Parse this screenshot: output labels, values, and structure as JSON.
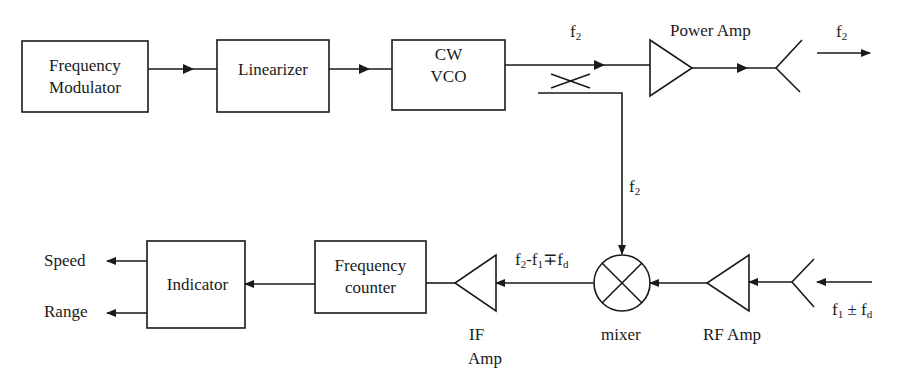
{
  "diagram": {
    "type": "block-diagram",
    "title": "",
    "blocks": {
      "frequency_modulator": {
        "line1": "Frequency",
        "line2": "Modulator"
      },
      "linearizer": {
        "label": "Linearizer"
      },
      "cw_vco": {
        "line1": "CW",
        "line2": "VCO"
      },
      "power_amp": {
        "label": "Power Amp"
      },
      "mixer": {
        "label": "mixer"
      },
      "rf_amp": {
        "label": "RF Amp"
      },
      "if_amp": {
        "line1": "IF",
        "line2": "Amp"
      },
      "frequency_counter": {
        "line1": "Frequency",
        "line2": "counter"
      },
      "indicator": {
        "label": "Indicator"
      }
    },
    "signals": {
      "vco_out": {
        "base": "f",
        "sub": "2"
      },
      "tx_out": {
        "base": "f",
        "sub": "2"
      },
      "lo_feed": {
        "base": "f",
        "sub": "2"
      },
      "if_signal": {
        "p1": "f",
        "s1": "2",
        "p2": "-f",
        "s2": "1",
        "p3": "∓f",
        "s3": "d"
      },
      "rx_in": {
        "p1": "f",
        "s1": "1",
        "p2": " ± f",
        "s2": "d"
      }
    },
    "outputs": {
      "speed": "Speed",
      "range": "Range"
    },
    "colors": {
      "line": "#1a1a1a",
      "background": "#ffffff"
    }
  }
}
